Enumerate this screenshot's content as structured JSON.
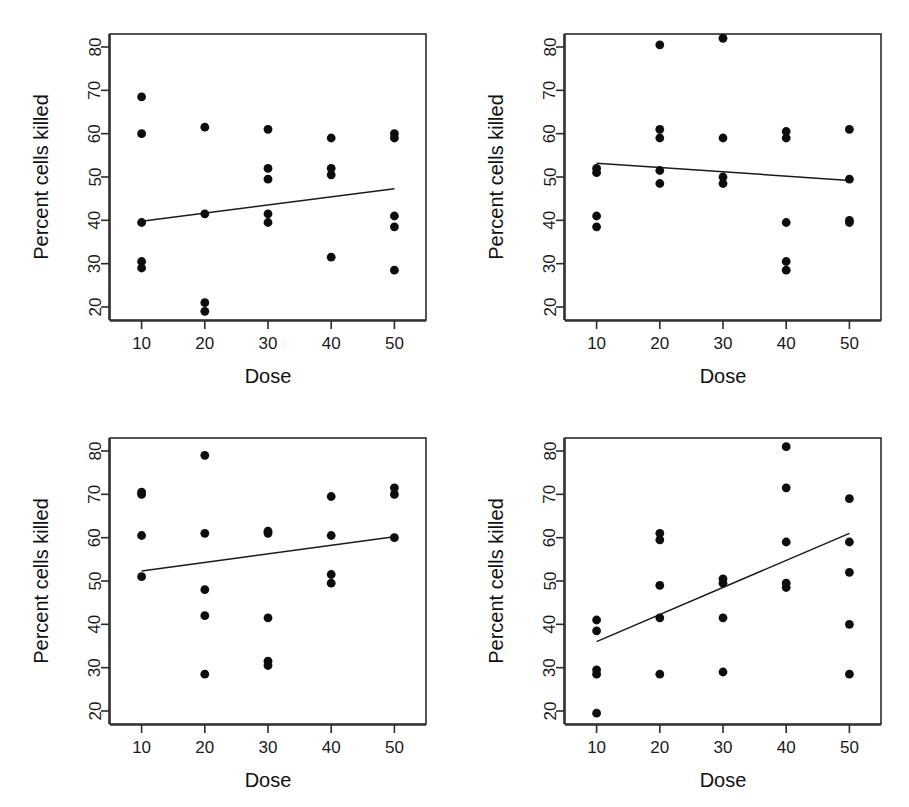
{
  "figure": {
    "type": "scatter-matrix",
    "panel_count": 4,
    "background": "#ffffff",
    "point_color": "#0d0d0d",
    "line_color": "#1a1a1a"
  },
  "axes": {
    "xlabel": "Dose",
    "ylabel": "Percent cells killed",
    "xticks": [
      "10",
      "20",
      "30",
      "40",
      "50"
    ],
    "yticks": [
      "20",
      "30",
      "40",
      "50",
      "60",
      "70",
      "80"
    ],
    "xlim": [
      5,
      55
    ],
    "ylim": [
      17,
      83
    ]
  },
  "chart_data": [
    {
      "type": "scatter",
      "panel": "top-left",
      "title": "",
      "xlabel": "Dose",
      "ylabel": "Percent cells killed",
      "xlim": [
        5,
        55
      ],
      "ylim": [
        17,
        83
      ],
      "xticks": [
        10,
        20,
        30,
        40,
        50
      ],
      "yticks": [
        20,
        30,
        40,
        50,
        60,
        70,
        80
      ],
      "grid": false,
      "legend": "none",
      "x": [
        10,
        10,
        10,
        10,
        10,
        20,
        20,
        20,
        20,
        30,
        30,
        30,
        30,
        30,
        40,
        40,
        40,
        40,
        50,
        50,
        50,
        50,
        50
      ],
      "y": [
        68.5,
        60.0,
        39.5,
        30.5,
        29.0,
        61.5,
        41.5,
        21.0,
        19.0,
        61.0,
        52.0,
        49.5,
        41.5,
        39.5,
        59.0,
        52.0,
        50.5,
        31.5,
        60.0,
        59.0,
        41.0,
        38.5,
        28.5
      ],
      "fit_line": {
        "x": [
          10,
          50
        ],
        "y": [
          39.8,
          47.3
        ],
        "slope": 0.1875,
        "direction": "positive"
      }
    },
    {
      "type": "scatter",
      "panel": "top-right",
      "title": "",
      "xlabel": "Dose",
      "ylabel": "Percent cells killed",
      "xlim": [
        5,
        55
      ],
      "ylim": [
        17,
        83
      ],
      "xticks": [
        10,
        20,
        30,
        40,
        50
      ],
      "yticks": [
        20,
        30,
        40,
        50,
        60,
        70,
        80
      ],
      "grid": false,
      "legend": "none",
      "x": [
        10,
        10,
        10,
        10,
        20,
        20,
        20,
        20,
        20,
        30,
        30,
        30,
        30,
        40,
        40,
        40,
        40,
        40,
        50,
        50,
        50,
        50
      ],
      "y": [
        52.0,
        51.0,
        41.0,
        38.5,
        80.5,
        61.0,
        59.0,
        51.5,
        48.5,
        82.0,
        59.0,
        50.0,
        48.5,
        60.5,
        59.0,
        39.5,
        30.5,
        28.5,
        61.0,
        49.5,
        40.0,
        39.5
      ],
      "fit_line": {
        "x": [
          10,
          50
        ],
        "y": [
          53.2,
          49.2
        ],
        "slope": -0.1,
        "direction": "negative"
      }
    },
    {
      "type": "scatter",
      "panel": "bottom-left",
      "title": "",
      "xlabel": "Dose",
      "ylabel": "Percent cells killed",
      "xlim": [
        5,
        55
      ],
      "ylim": [
        17,
        83
      ],
      "xticks": [
        10,
        20,
        30,
        40,
        50
      ],
      "yticks": [
        20,
        30,
        40,
        50,
        60,
        70,
        80
      ],
      "grid": false,
      "legend": "none",
      "x": [
        10,
        10,
        10,
        10,
        20,
        20,
        20,
        20,
        20,
        30,
        30,
        30,
        30,
        30,
        40,
        40,
        40,
        40,
        50,
        50,
        50
      ],
      "y": [
        70.5,
        70.0,
        60.5,
        51.0,
        79.0,
        61.0,
        48.0,
        42.0,
        28.5,
        61.5,
        61.0,
        41.5,
        31.5,
        30.5,
        69.5,
        60.5,
        51.5,
        49.5,
        71.5,
        70.0,
        60.0
      ],
      "fit_line": {
        "x": [
          10,
          50
        ],
        "y": [
          52.3,
          60.2
        ],
        "slope": 0.1975,
        "direction": "positive"
      }
    },
    {
      "type": "scatter",
      "panel": "bottom-right",
      "title": "",
      "xlabel": "Dose",
      "ylabel": "Percent cells killed",
      "xlim": [
        5,
        55
      ],
      "ylim": [
        17,
        83
      ],
      "xticks": [
        10,
        20,
        30,
        40,
        50
      ],
      "yticks": [
        20,
        30,
        40,
        50,
        60,
        70,
        80
      ],
      "grid": false,
      "legend": "none",
      "x": [
        10,
        10,
        10,
        10,
        10,
        20,
        20,
        20,
        20,
        20,
        30,
        30,
        30,
        30,
        40,
        40,
        40,
        40,
        40,
        50,
        50,
        50,
        50,
        50
      ],
      "y": [
        41.0,
        38.5,
        29.5,
        28.5,
        19.5,
        61.0,
        59.5,
        49.0,
        41.5,
        28.5,
        50.5,
        49.5,
        41.5,
        29.0,
        81.0,
        71.5,
        59.0,
        49.5,
        48.5,
        69.0,
        59.0,
        52.0,
        40.0,
        28.5
      ],
      "fit_line": {
        "x": [
          10,
          50
        ],
        "y": [
          36.0,
          61.0
        ],
        "slope": 0.625,
        "direction": "positive"
      }
    }
  ]
}
